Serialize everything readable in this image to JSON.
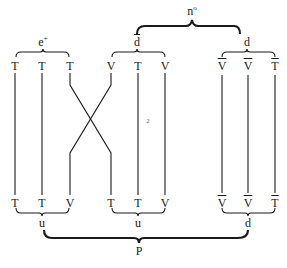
{
  "diagram": {
    "title": "",
    "top_group": {
      "label": "n",
      "superscript": "o"
    },
    "groups_top": [
      {
        "id": "e_plus",
        "label": "e",
        "superscript": "+",
        "overbar": false
      },
      {
        "id": "d_bar",
        "label": "d",
        "superscript": "",
        "overbar": true
      },
      {
        "id": "d",
        "label": "d",
        "superscript": "",
        "overbar": false
      }
    ],
    "top_row": [
      {
        "label": "T",
        "overbar": false
      },
      {
        "label": "T",
        "overbar": false
      },
      {
        "label": "T",
        "overbar": false
      },
      {
        "label": "V",
        "overbar": false
      },
      {
        "label": "T",
        "overbar": false
      },
      {
        "label": "V",
        "overbar": false
      },
      {
        "label": "V",
        "overbar": true
      },
      {
        "label": "V",
        "overbar": true
      },
      {
        "label": "T",
        "overbar": true
      }
    ],
    "bottom_row": [
      {
        "label": "T",
        "overbar": false
      },
      {
        "label": "T",
        "overbar": false
      },
      {
        "label": "V",
        "overbar": false
      },
      {
        "label": "T",
        "overbar": false
      },
      {
        "label": "T",
        "overbar": false
      },
      {
        "label": "V",
        "overbar": false
      },
      {
        "label": "V",
        "overbar": true
      },
      {
        "label": "V",
        "overbar": true
      },
      {
        "label": "T",
        "overbar": true
      }
    ],
    "groups_bottom": [
      {
        "id": "u1",
        "label": "u"
      },
      {
        "id": "u2",
        "label": "u"
      },
      {
        "id": "d2",
        "label": "d"
      }
    ],
    "bottom_group": {
      "label": "P"
    },
    "crossing": {
      "from_column": 3,
      "to_column": 4,
      "note": "strands cross"
    },
    "marker": "2",
    "colors": {
      "ink": "#1a1a1a",
      "background": "#ffffff"
    }
  }
}
